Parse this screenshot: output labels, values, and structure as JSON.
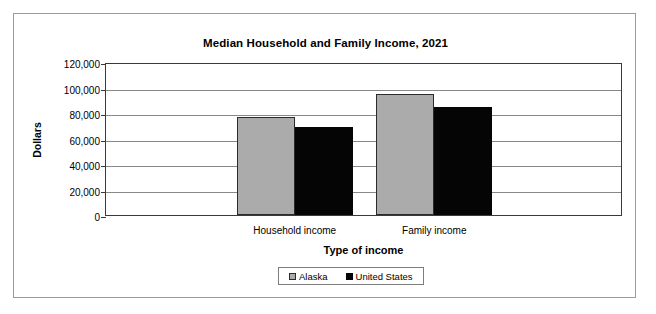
{
  "chart_data": {
    "type": "bar",
    "title": "Median Household and Family Income, 2021",
    "xlabel": "Type of income",
    "ylabel": "Dollars",
    "categories": [
      "Household income",
      "Family income"
    ],
    "series": [
      {
        "name": "Alaska",
        "color": "#ababab",
        "values": [
          77000,
          95000
        ]
      },
      {
        "name": "United States",
        "color": "#050505",
        "values": [
          69000,
          85000
        ]
      }
    ],
    "ylim": [
      0,
      120000
    ],
    "yticks": [
      0,
      20000,
      40000,
      60000,
      80000,
      100000,
      120000
    ],
    "ytick_labels": [
      "0",
      "20,000",
      "40,000",
      "60,000",
      "80,000",
      "100,000",
      "120,000"
    ],
    "grid": true,
    "legend_position": "bottom",
    "legend_entries": [
      "Alaska",
      "United States"
    ]
  }
}
